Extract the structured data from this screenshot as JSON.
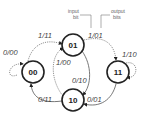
{
  "diagram": {
    "type": "state-diagram",
    "annotations": {
      "input": "input",
      "input2": "bit",
      "output": "output",
      "output2": "bits"
    },
    "states": [
      {
        "id": "00",
        "label": "00"
      },
      {
        "id": "01",
        "label": "01"
      },
      {
        "id": "11",
        "label": "11"
      },
      {
        "id": "10",
        "label": "10"
      }
    ],
    "transitions": [
      {
        "from": "00",
        "to": "00",
        "label": "0/00"
      },
      {
        "from": "00",
        "to": "01",
        "label": "1/11"
      },
      {
        "from": "01",
        "to": "11",
        "label": "1/01"
      },
      {
        "from": "11",
        "to": "11",
        "label": "1/10"
      },
      {
        "from": "10",
        "to": "01",
        "label": "1/00"
      },
      {
        "from": "01",
        "to": "10",
        "label": "0/10"
      },
      {
        "from": "10",
        "to": "00",
        "label": "0/11"
      },
      {
        "from": "11",
        "to": "10",
        "label": "0/01"
      }
    ]
  }
}
